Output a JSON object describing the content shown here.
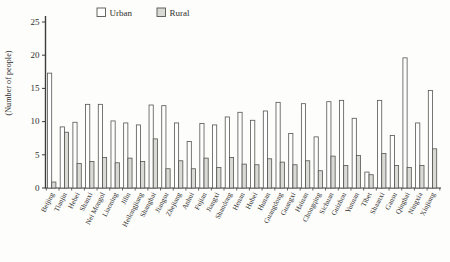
{
  "figure": {
    "ylabel": "(Number of people)",
    "legend": [
      {
        "label": "Urban",
        "fill": "#fefefe"
      },
      {
        "label": "Rural",
        "fill": "#d9d9d6"
      }
    ],
    "axis_color": "#3c3c3c",
    "bar_stroke": "#555550"
  },
  "chart_data": {
    "type": "bar",
    "title": "",
    "xlabel": "",
    "ylabel": "(Number of people)",
    "ylim": [
      0,
      25
    ],
    "yticks": [
      0,
      5,
      10,
      15,
      20,
      25
    ],
    "grid": false,
    "legend_position": "top-left",
    "categories": [
      "Beijing",
      "Tianjin",
      "Hebei",
      "Shanxi",
      "Nei Mongol",
      "Liaoning",
      "Jilin",
      "Heilongjiang",
      "Shanghai",
      "Jiangsu",
      "Zhejiang",
      "Anhui",
      "Fujian",
      "Jiangxi",
      "Shandong",
      "Henan",
      "Hubei",
      "Hunan",
      "Guangdong",
      "Guangxi",
      "Hainan",
      "Chongqing",
      "Sichuan",
      "Guizhou",
      "Yunnan",
      "Tibet",
      "Shaanxi",
      "Gansu",
      "Qinghai",
      "Ningxia",
      "Xinjiang"
    ],
    "series": [
      {
        "name": "Urban",
        "fill": "#fefefe",
        "values": [
          17.3,
          9.2,
          9.9,
          12.6,
          12.6,
          10.1,
          9.8,
          9.5,
          12.5,
          12.4,
          9.8,
          7.0,
          9.7,
          9.5,
          10.7,
          11.4,
          10.2,
          11.6,
          12.9,
          8.2,
          12.7,
          7.7,
          13.0,
          13.2,
          10.5,
          2.4,
          13.2,
          7.9,
          19.6,
          9.8,
          14.7
        ]
      },
      {
        "name": "Rural",
        "fill": "#d9d9d6",
        "values": [
          0.9,
          8.4,
          3.7,
          4.0,
          4.6,
          3.8,
          4.5,
          4.0,
          7.4,
          2.9,
          4.1,
          2.9,
          4.5,
          3.1,
          4.6,
          3.6,
          3.5,
          4.4,
          3.9,
          3.5,
          4.1,
          2.6,
          4.8,
          3.4,
          4.9,
          2.0,
          5.2,
          3.4,
          3.1,
          3.4,
          5.9
        ]
      }
    ]
  }
}
